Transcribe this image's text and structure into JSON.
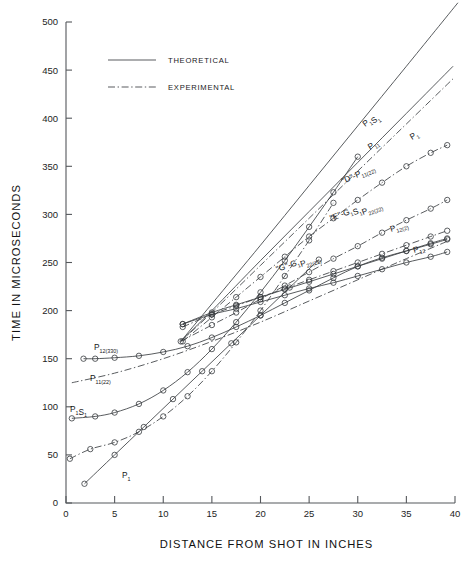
{
  "chart_data": {
    "type": "line",
    "title": "",
    "xlabel": "DISTANCE FROM SHOT IN INCHES",
    "ylabel": "TIME IN MICROSECONDS",
    "xlim": [
      0,
      40
    ],
    "ylim": [
      0,
      500
    ],
    "xticks": [
      0,
      5,
      10,
      15,
      20,
      25,
      30,
      35,
      40
    ],
    "xticklabels": [
      "0",
      "5",
      "10",
      "15",
      "20",
      "25",
      "30",
      "35",
      "40"
    ],
    "yticks": [
      0,
      50,
      100,
      150,
      200,
      250,
      300,
      350,
      400,
      450,
      500
    ],
    "yticklabels": [
      "0",
      "50",
      "100",
      "150",
      "200",
      "250",
      "300",
      "350",
      "400",
      "450",
      "500"
    ],
    "grid": false,
    "legend_position": "upper-left-inset",
    "legend": [
      {
        "label": "THEORETICAL",
        "style": "solid"
      },
      {
        "label": "EXPERIMENTAL",
        "style": "dash-dot"
      }
    ],
    "marker": "open-circle",
    "series": [
      {
        "name": "P1S1",
        "label": "P",
        "label_sub": "1",
        "label_tail": "S",
        "label_tail_sub": "1",
        "style": "solid",
        "markers": false,
        "x": [
          11.8,
          15,
          20,
          25,
          30,
          35,
          40.3
        ],
        "y": [
          168,
          207,
          268,
          330,
          392,
          454,
          520
        ]
      },
      {
        "name": "P11",
        "label": "P",
        "label_sub": "11",
        "style": "solid",
        "markers": false,
        "x": [
          11.8,
          15,
          20,
          25,
          30,
          35,
          39.8
        ],
        "y": [
          168,
          200,
          252,
          303,
          354,
          405,
          454
        ]
      },
      {
        "name": "P1",
        "label": "P",
        "label_sub": "1",
        "style": "dash-dot",
        "markers": false,
        "x": [
          11.8,
          15,
          20,
          25,
          30,
          35,
          39.8
        ],
        "y": [
          168,
          198,
          247,
          296,
          345,
          394,
          441
        ]
      },
      {
        "name": "D-P11(22)",
        "label": "\"D\"-P",
        "label_sub": "11(22)",
        "style": "dash-dot",
        "markers": true,
        "x": [
          12.0,
          15,
          17.5,
          20,
          22.5,
          25,
          27.5,
          30,
          32.5,
          35,
          37.5,
          39.2
        ],
        "y": [
          168,
          193,
          214,
          235,
          256,
          277,
          296,
          315,
          333,
          350,
          364,
          372
        ]
      },
      {
        "name": "E-G1S1P22(22)",
        "label": "\"E\"-G",
        "label_sub": "1",
        "label_tail": "S",
        "label_tail_sub": "1",
        "label_tail2": "P",
        "label_tail2_sub": "22(22)",
        "style": "dash-dot",
        "markers": true,
        "x": [
          11.8,
          15,
          17.5,
          20,
          22.5,
          25,
          27.5,
          30,
          32.5,
          35,
          37.5,
          39.2
        ],
        "y": [
          168,
          185,
          198,
          212,
          226,
          240,
          254,
          267,
          281,
          294,
          306,
          315
        ]
      },
      {
        "name": "G-G1P22(22)",
        "label": "\"G\"-G",
        "label_sub": "1",
        "label_tail2": "P",
        "label_tail2_sub": "22(22)",
        "style": "dash-dot",
        "markers": true,
        "x": [
          12.0,
          15,
          17.5,
          20,
          22.5,
          25,
          27.5,
          30,
          32.5,
          35,
          37.5,
          39.2
        ],
        "y": [
          183,
          196,
          205,
          214,
          223,
          232,
          241,
          250,
          259,
          268,
          277,
          283
        ]
      },
      {
        "name": "P12(2)",
        "label": "P",
        "label_sub": "12(2)",
        "style": "solid",
        "markers": true,
        "x": [
          12.0,
          15,
          17.5,
          20,
          22.5,
          25,
          27.5,
          30,
          32.5,
          35,
          37.5,
          39.2
        ],
        "y": [
          186,
          198,
          206,
          214,
          222,
          230,
          238,
          246,
          254,
          262,
          270,
          275
        ]
      },
      {
        "name": "P12",
        "label": "P",
        "label_sub": "12",
        "style": "solid",
        "markers": true,
        "x": [
          12.0,
          15,
          17.5,
          20,
          22.5,
          25,
          27.5,
          30,
          32.5,
          35,
          37.5,
          39.2
        ],
        "y": [
          186,
          196,
          202,
          209,
          216,
          223,
          229,
          236,
          243,
          250,
          256,
          261
        ]
      },
      {
        "name": "P12(330)",
        "label": "P",
        "label_sub": "12(330)",
        "style": "solid",
        "markers": true,
        "x": [
          1.8,
          3.0,
          5.0,
          7.5,
          10.0,
          12.5,
          15.0,
          17.5,
          20.0,
          22.5,
          25.0,
          27.5,
          30.0,
          32.5,
          35.0,
          37.5,
          39.2
        ],
        "y": [
          150,
          150,
          151,
          153,
          157,
          163,
          172,
          183,
          195,
          208,
          221,
          234,
          246,
          255,
          262,
          269,
          274
        ]
      },
      {
        "name": "P11(22)",
        "label": "P",
        "label_sub": "11(22)",
        "style": "dash-dot",
        "markers": false,
        "x": [
          0.6,
          5,
          10,
          15,
          20,
          25,
          30,
          35,
          39.2
        ],
        "y": [
          125,
          135,
          150,
          168,
          188,
          210,
          232,
          254,
          272
        ]
      },
      {
        "name": "P1S1-lower",
        "label": "P",
        "label_sub": "1",
        "label_tail": "S",
        "label_tail_sub": "1",
        "style": "solid",
        "markers": true,
        "x": [
          0.6,
          3.0,
          5.0,
          7.5,
          10.0,
          12.5,
          15.0,
          17.5,
          20.0,
          22.5,
          25.0,
          27.5,
          30.0
        ],
        "y": [
          88,
          90,
          94,
          103,
          117,
          136,
          160,
          188,
          219,
          252,
          287,
          323,
          360
        ]
      },
      {
        "name": "P1-lower",
        "label": "P",
        "label_sub": "1",
        "style": "dash-dot",
        "markers": true,
        "x": [
          0.4,
          2.5,
          5.0,
          7.5,
          10.0,
          12.5,
          15.0,
          17.5,
          20.0,
          22.5,
          25.0,
          27.5
        ],
        "y": [
          46,
          56,
          63,
          74,
          90,
          111,
          137,
          167,
          200,
          236,
          273,
          312
        ]
      },
      {
        "name": "P1-bottom",
        "label": "P",
        "label_sub": "1",
        "style": "solid",
        "markers": true,
        "x": [
          1.9,
          5.0,
          8.0,
          11.0,
          14.0,
          17.0,
          20.0,
          23.0,
          26.0
        ],
        "y": [
          20,
          50,
          79,
          108,
          137,
          166,
          195,
          224,
          253
        ]
      }
    ],
    "curve_labels": [
      {
        "name": "P1S1-upper",
        "text": "P",
        "sub": "1",
        "text2": "S",
        "sub2": "1",
        "x": 365,
        "y": 127,
        "rot": -36
      },
      {
        "name": "P11-upper",
        "text": "P",
        "sub": "11",
        "x": 370,
        "y": 150,
        "rot": -33
      },
      {
        "name": "P1-upper",
        "text": "P",
        "sub": "1",
        "x": 412,
        "y": 140,
        "rot": -33
      },
      {
        "name": "D-P11(22)",
        "text": "\"D\"-P",
        "sub": "11(22)",
        "x": 343,
        "y": 184,
        "rot": -24
      },
      {
        "name": "E-G1S1P22",
        "text": "\"E\"-G",
        "sub": "1",
        "text2": "S",
        "sub2": "1",
        "text3": "P",
        "sub3": "22(22)",
        "x": 331,
        "y": 221,
        "rot": -20
      },
      {
        "name": "G-G1P22",
        "text": "\"G\"-G",
        "sub": "1",
        "text3": "P",
        "sub3": "22(22)",
        "x": 277,
        "y": 272,
        "rot": -18
      },
      {
        "name": "P12(2)",
        "text": "P",
        "sub": "12(2)",
        "x": 391,
        "y": 232,
        "rot": -17
      },
      {
        "name": "P12",
        "text": "P",
        "sub": "12",
        "x": 414,
        "y": 253,
        "rot": -15
      },
      {
        "name": "P12(330)",
        "text": "P",
        "sub": "12(330)",
        "x": 94,
        "y": 350,
        "rot": 0
      },
      {
        "name": "P11(22)",
        "text": "P",
        "sub": "11(22)",
        "x": 90,
        "y": 381,
        "rot": 0
      },
      {
        "name": "P1S1-lower",
        "text": "P",
        "sub": "1",
        "text2": "S",
        "sub2": "1",
        "x": 70,
        "y": 412,
        "rot": 0
      },
      {
        "name": "P1-bottom",
        "text": "P",
        "sub": "1",
        "x": 122,
        "y": 478,
        "rot": 0
      }
    ]
  }
}
